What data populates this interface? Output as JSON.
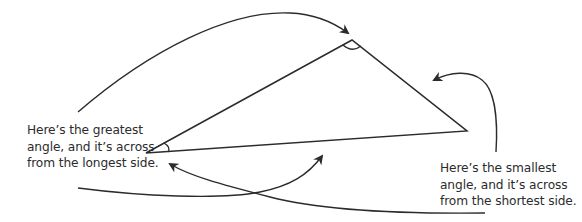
{
  "diagram": {
    "stroke_color": "#2b2b2b",
    "background": "#ffffff",
    "triangle": {
      "vertices": {
        "top": [
          352,
          40
        ],
        "left": [
          146,
          153
        ],
        "right": [
          467,
          131
        ]
      },
      "marked_angles": [
        "top",
        "left"
      ]
    },
    "annotations": [
      {
        "id": "greatest",
        "lines": [
          "Here’s the greatest",
          "angle, and it’s across",
          "from the longest side."
        ],
        "points_to": [
          "top-angle",
          "longest-side"
        ]
      },
      {
        "id": "smallest",
        "lines": [
          "Here’s the smallest",
          "angle, and it’s across",
          "from the shortest side."
        ],
        "points_to": [
          "left-angle",
          "shortest-side"
        ]
      }
    ]
  }
}
